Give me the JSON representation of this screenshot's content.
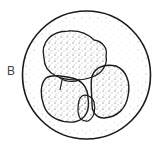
{
  "figure": {
    "label": "B",
    "colors": {
      "ink": "#1a1a1a",
      "background": "#ffffff"
    }
  }
}
